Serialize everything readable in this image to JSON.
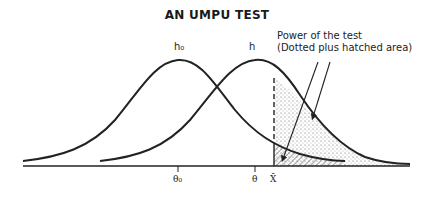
{
  "title": "AN UMPU TEST",
  "annotation": {
    "line1": "Power of the test",
    "line2": "(Dotted plus hatched area)"
  },
  "curves": {
    "h0_label": "h₀",
    "h_label": "h"
  },
  "axis": {
    "ticks": [
      {
        "label": "θ₀"
      },
      {
        "label": "θ"
      },
      {
        "label": "X̄"
      }
    ]
  },
  "colors": {
    "line": "#222222",
    "background": "#ffffff",
    "dots": "#555555"
  }
}
